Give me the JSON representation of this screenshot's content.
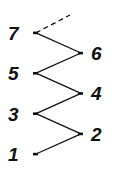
{
  "diagram": {
    "nodes": [
      {
        "id": "1",
        "label": "1",
        "side": "left"
      },
      {
        "id": "2",
        "label": "2",
        "side": "right"
      },
      {
        "id": "3",
        "label": "3",
        "side": "left"
      },
      {
        "id": "4",
        "label": "4",
        "side": "right"
      },
      {
        "id": "5",
        "label": "5",
        "side": "left"
      },
      {
        "id": "6",
        "label": "6",
        "side": "right"
      },
      {
        "id": "7",
        "label": "7",
        "side": "left"
      }
    ],
    "edges": [
      {
        "from": "1",
        "to": "2",
        "style": "solid"
      },
      {
        "from": "2",
        "to": "3",
        "style": "solid"
      },
      {
        "from": "3",
        "to": "4",
        "style": "solid"
      },
      {
        "from": "4",
        "to": "5",
        "style": "solid"
      },
      {
        "from": "5",
        "to": "6",
        "style": "solid"
      },
      {
        "from": "6",
        "to": "7",
        "style": "solid"
      },
      {
        "from": "7",
        "to": "continuation",
        "style": "dashed"
      }
    ],
    "colors": {
      "ink": "#111111",
      "background": "#ffffff"
    }
  }
}
